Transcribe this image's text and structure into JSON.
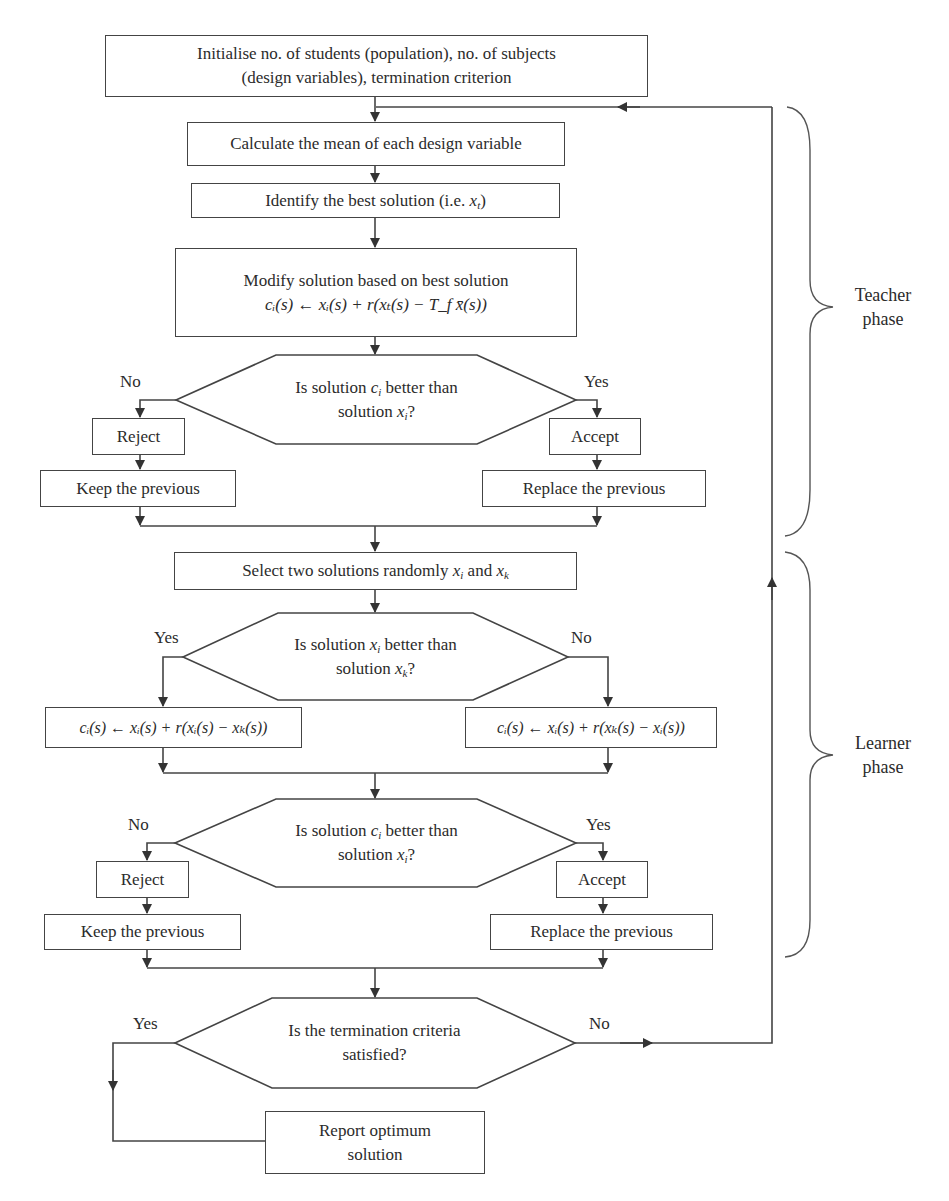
{
  "nodes": {
    "init": {
      "line1": "Initialise no. of students (population), no. of subjects",
      "line2": "(design variables), termination criterion"
    },
    "mean": {
      "text": "Calculate the mean of each design variable"
    },
    "best": {
      "text": "Identify the best solution (i.e. ",
      "var": "x",
      "sub": "t",
      "close": ")"
    },
    "modify": {
      "line1": "Modify solution based on best solution",
      "formula": "cᵢ(s) ← xᵢ(s) + r(xₜ(s) − T_f x̄(s))"
    },
    "decision1": {
      "line1_pre": "Is solution ",
      "line1_var": "c",
      "line1_sub": "i",
      "line1_post": " better than",
      "line2_pre": "solution ",
      "line2_var": "x",
      "line2_sub": "i",
      "line2_post": "?"
    },
    "reject1": {
      "text": "Reject"
    },
    "accept1": {
      "text": "Accept"
    },
    "keep1": {
      "text": "Keep the previous"
    },
    "replace1": {
      "text": "Replace the previous"
    },
    "select": {
      "pre": "Select two solutions randomly ",
      "v1": "x",
      "s1": "i",
      "mid": " and ",
      "v2": "x",
      "s2": "k"
    },
    "decision2": {
      "line1_pre": "Is solution ",
      "line1_var": "x",
      "line1_sub": "i",
      "line1_post": " better than",
      "line2_pre": "solution ",
      "line2_var": "x",
      "line2_sub": "k",
      "line2_post": "?"
    },
    "update_left": {
      "formula": "cᵢ(s) ← xᵢ(s) + r(xᵢ(s) − xₖ(s))"
    },
    "update_right": {
      "formula": "cᵢ(s) ← xᵢ(s) + r(xₖ(s) − xᵢ(s))"
    },
    "decision3": {
      "line1_pre": "Is solution ",
      "line1_var": "c",
      "line1_sub": "i",
      "line1_post": " better than",
      "line2_pre": "solution ",
      "line2_var": "x",
      "line2_sub": "i",
      "line2_post": "?"
    },
    "reject2": {
      "text": "Reject"
    },
    "accept2": {
      "text": "Accept"
    },
    "keep2": {
      "text": "Keep the previous"
    },
    "replace2": {
      "text": "Replace the previous"
    },
    "decision4": {
      "line1": "Is the termination criteria",
      "line2": "satisfied?"
    },
    "report": {
      "line1": "Report optimum",
      "line2": "solution"
    }
  },
  "branch_labels": {
    "d1_no": "No",
    "d1_yes": "Yes",
    "d2_yes": "Yes",
    "d2_no": "No",
    "d3_no": "No",
    "d3_yes": "Yes",
    "d4_yes": "Yes",
    "d4_no": "No"
  },
  "phases": {
    "teacher": {
      "line1": "Teacher",
      "line2": "phase"
    },
    "learner": {
      "line1": "Learner",
      "line2": "phase"
    }
  },
  "colors": {
    "line": "#444444",
    "text": "#2b2b2b",
    "background": "#ffffff"
  }
}
